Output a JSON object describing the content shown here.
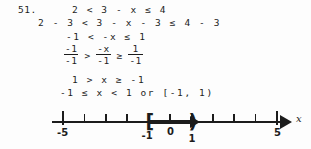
{
  "problem": {
    "number": "51.",
    "steps": [
      "2 < 3 - x ≤ 4",
      "2 - 3 < 3 - x - 3 ≤ 4 - 3",
      "-1 < -x ≤ 1",
      "1 > x ≥ -1",
      "-1 ≤ x < 1 or [-1, 1)"
    ],
    "fraction_step": {
      "left": {
        "numerator": "-1",
        "denominator": "-1"
      },
      "operator_1": ">",
      "middle": {
        "numerator": "-x",
        "denominator": "-1"
      },
      "operator_2": "≥",
      "right": {
        "numerator": "1",
        "denominator": "-1"
      }
    }
  },
  "number_line": {
    "axis_label": "x",
    "min": -5,
    "max": 5,
    "ticks": [
      {
        "value": -5,
        "label": "-5",
        "major": true
      },
      {
        "value": -4,
        "label": "",
        "major": false
      },
      {
        "value": -3,
        "label": "",
        "major": false
      },
      {
        "value": -2,
        "label": "",
        "major": false
      },
      {
        "value": -1,
        "label": "-1",
        "major": false
      },
      {
        "value": 0,
        "label": "0",
        "major": false
      },
      {
        "value": 1,
        "label": "1",
        "major": false
      },
      {
        "value": 2,
        "label": "",
        "major": false
      },
      {
        "value": 3,
        "label": "",
        "major": false
      },
      {
        "value": 4,
        "label": "",
        "major": false
      },
      {
        "value": 5,
        "label": "5",
        "major": true
      }
    ],
    "interval": {
      "start": -1,
      "end": 1,
      "start_symbol": "[",
      "end_symbol": ")",
      "notation": "[-1, 1)"
    }
  },
  "colors": {
    "ink": "#1c1c1c",
    "paper": "#fdfdfd"
  }
}
